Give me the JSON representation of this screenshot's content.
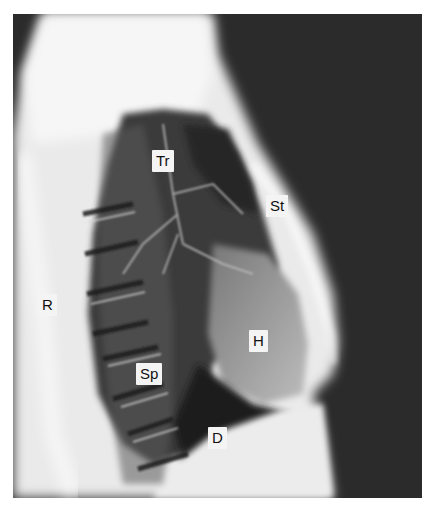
{
  "figure": {
    "type": "lateral chest radiograph",
    "labels": [
      {
        "id": "Tr",
        "text": "Tr",
        "x": 152,
        "y": 152
      },
      {
        "id": "St",
        "text": "St",
        "x": 266,
        "y": 196
      },
      {
        "id": "R",
        "text": "R",
        "x": 38,
        "y": 295
      },
      {
        "id": "H",
        "text": "H",
        "x": 249,
        "y": 330
      },
      {
        "id": "Sp",
        "text": "Sp",
        "x": 137,
        "y": 364
      },
      {
        "id": "D",
        "text": "D",
        "x": 208,
        "y": 427
      }
    ]
  }
}
